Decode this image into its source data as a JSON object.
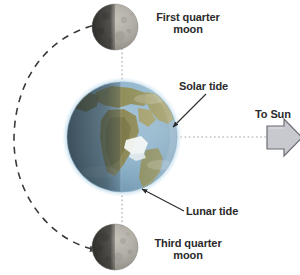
{
  "diagram": {
    "type": "earth-moon-tide-diagram",
    "background_color": "#ffffff",
    "text_color": "#2b2b2b",
    "labels": {
      "first_quarter_moon": "First quarter\nmoon",
      "third_quarter_moon": "Third quarter\nmoon",
      "solar_tide": "Solar tide",
      "lunar_tide": "Lunar tide",
      "to_sun": "To Sun"
    },
    "bodies": {
      "earth": {
        "name": "Earth",
        "center_x": 122,
        "center_y": 137,
        "radius": 55,
        "ocean_color": "#7fa9c4",
        "land_color": "#9a9254",
        "night_shade_color": "#4a5a63",
        "atmosphere_glow_color": "#bcd9ea"
      },
      "first_quarter_moon": {
        "name": "First quarter moon",
        "center_x": 115,
        "center_y": 27,
        "radius": 23,
        "lit_color": "#b9b6ae",
        "dark_color": "#4a4a43"
      },
      "third_quarter_moon": {
        "name": "Third quarter moon",
        "center_x": 115,
        "center_y": 247,
        "radius": 23,
        "lit_color": "#b9b6ae",
        "dark_color": "#4a4a43"
      }
    },
    "orbit": {
      "name": "moon-orbit-path",
      "style": "dashed",
      "color": "#3a3a3a",
      "has_arrowhead": true,
      "arrow_target": "third_quarter_moon"
    },
    "alignment_lines": {
      "vertical": {
        "name": "lunar-alignment-line",
        "style": "dotted",
        "color": "#9aa3a8"
      },
      "horizontal": {
        "name": "solar-alignment-line",
        "style": "dotted",
        "color": "#9aa3a8"
      }
    },
    "sun_arrow": {
      "name": "to-sun-arrow",
      "direction": "right",
      "fill_color": "#c8c8cf",
      "stroke_color": "#6d6d74"
    },
    "leader_lines": {
      "solar_tide": {
        "from_x": 205,
        "from_y": 95,
        "to_x": 172,
        "to_y": 128,
        "color": "#2b2b2b"
      },
      "lunar_tide": {
        "from_x": 183,
        "from_y": 212,
        "to_x": 141,
        "to_y": 189,
        "color": "#2b2b2b"
      }
    }
  }
}
